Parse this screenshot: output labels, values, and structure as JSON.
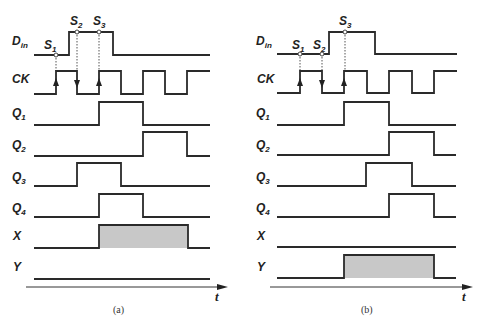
{
  "figure": {
    "colors": {
      "line": "#2a2a2a",
      "shade": "#c8c8c8",
      "background": "#ffffff"
    }
  },
  "signal_labels": {
    "din": "D",
    "din_sub": "in",
    "ck": "CK",
    "q": "Q",
    "q1_sub": "1",
    "q2_sub": "2",
    "q3_sub": "3",
    "q4_sub": "4",
    "x": "X",
    "y": "Y"
  },
  "sample_labels": {
    "s": "S",
    "s1_sub": "1",
    "s2_sub": "2",
    "s3_sub": "3"
  },
  "axis_label": "t",
  "panels": [
    {
      "caption": "(a)",
      "din_rise_x": 69,
      "din_fall_x": 113,
      "ck_edges": [
        56,
        77,
        99,
        121,
        143,
        165,
        187
      ],
      "q1": [
        99,
        143
      ],
      "q2": [
        143,
        187
      ],
      "q3": [
        77,
        121
      ],
      "q4": [
        99,
        143
      ],
      "x_pulse": [
        99,
        188
      ],
      "y_pulse": null,
      "samples": [
        {
          "name": "S1",
          "x": 56
        },
        {
          "name": "S2",
          "x": 77
        },
        {
          "name": "S3",
          "x": 99
        }
      ]
    },
    {
      "caption": "(b)",
      "din_rise_x": 329,
      "din_fall_x": 375,
      "ck_edges": [
        300,
        322,
        344,
        367,
        389,
        412,
        434
      ],
      "q1": [
        344,
        389
      ],
      "q2": [
        389,
        434
      ],
      "q3": [
        366,
        412
      ],
      "q4": [
        389,
        434
      ],
      "x_pulse": null,
      "y_pulse": [
        344,
        434
      ],
      "samples": [
        {
          "name": "S1",
          "x": 300
        },
        {
          "name": "S2",
          "x": 322
        },
        {
          "name": "S3",
          "x": 345
        }
      ]
    }
  ]
}
